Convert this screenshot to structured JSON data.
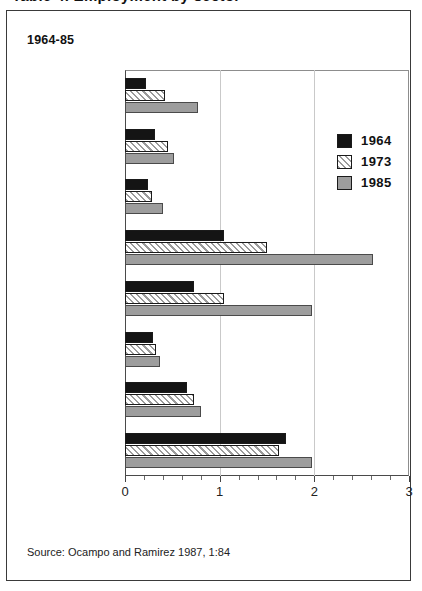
{
  "table_title": "Table 4. Employment by sector",
  "subtitle": "1964-85",
  "source": "Source: Ocampo and Ramirez 1987, 1:84",
  "legend": {
    "items": [
      {
        "label": "1964",
        "swatch": "black-solid",
        "color": "#141414"
      },
      {
        "label": "1973",
        "swatch": "hatched-diagonal",
        "color": "#ffffff"
      },
      {
        "label": "1985",
        "swatch": "gray-solid",
        "color": "#9d9d9d"
      }
    ]
  },
  "chart_data": {
    "type": "bar",
    "orientation": "horizontal",
    "xlabel": "",
    "ylabel": "",
    "xlim": [
      0,
      3
    ],
    "xticks": [
      "0",
      "1",
      "2",
      "3"
    ],
    "xtick_values": [
      0,
      1,
      2,
      3
    ],
    "minor_tick_step": 0.2,
    "grid": "vertical gridlines at 1 and 2",
    "legend_position": "upper-right inside plot",
    "categories": [
      "public",
      "industry",
      "construction",
      "other private sectors",
      "independent informal",
      "coffee",
      "other modern agriculture",
      "traditional agriculture"
    ],
    "series": [
      {
        "name": "1964",
        "values": [
          0.22,
          0.32,
          0.24,
          1.05,
          0.73,
          0.3,
          0.65,
          1.7
        ]
      },
      {
        "name": "1973",
        "values": [
          0.42,
          0.45,
          0.29,
          1.5,
          1.05,
          0.33,
          0.73,
          1.63
        ]
      },
      {
        "name": "1985",
        "values": [
          0.77,
          0.52,
          0.4,
          2.62,
          1.98,
          0.37,
          0.8,
          1.98
        ]
      }
    ]
  }
}
